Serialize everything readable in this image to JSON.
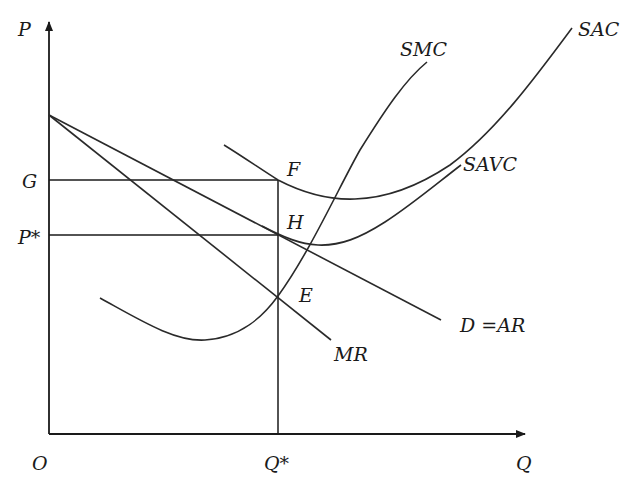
{
  "diagram": {
    "axes": {
      "y_label": "P",
      "x_label": "Q",
      "origin_label": "O"
    },
    "y_ticks": [
      {
        "label": "G"
      },
      {
        "label": "P*"
      }
    ],
    "x_ticks": [
      {
        "label": "Q*"
      }
    ],
    "points": {
      "F": "F",
      "H": "H",
      "E": "E"
    },
    "curves": {
      "smc": "SMC",
      "sac": "SAC",
      "savc": "SAVC",
      "demand": "D =AR",
      "mr": "MR"
    }
  }
}
